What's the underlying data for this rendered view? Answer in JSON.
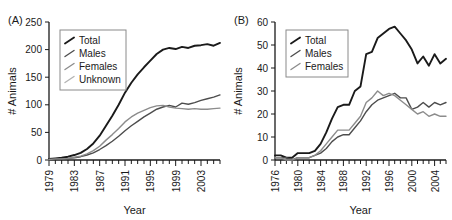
{
  "figure": {
    "panels": [
      {
        "caption": "(A)",
        "ylabel": "# Animals",
        "xlabel": "Year",
        "legend": [
          {
            "label": "Total",
            "color": "#1a1a1a"
          },
          {
            "label": "Males",
            "color": "#4d4d4d"
          },
          {
            "label": "Females",
            "color": "#8c8c8c"
          },
          {
            "label": "Unknown",
            "color": "#b3b3b3"
          }
        ]
      },
      {
        "caption": "(B)",
        "ylabel": "# Animals",
        "xlabel": "Year",
        "legend": [
          {
            "label": "Total",
            "color": "#1a1a1a"
          },
          {
            "label": "Males",
            "color": "#4d4d4d"
          },
          {
            "label": "Females",
            "color": "#8c8c8c"
          }
        ]
      }
    ]
  },
  "chart_data": [
    {
      "type": "line",
      "panel": "(A)",
      "title": "",
      "xlabel": "Year",
      "ylabel": "# Animals",
      "xlim": [
        1979,
        2006
      ],
      "ylim": [
        0,
        250
      ],
      "yticks": [
        0,
        50,
        100,
        150,
        200,
        250
      ],
      "xticks_labeled": [
        1979,
        1983,
        1987,
        1991,
        1995,
        1999,
        2003
      ],
      "xtick_step": 1,
      "grid": false,
      "legend_position": "upper-left",
      "x": [
        1979,
        1980,
        1981,
        1982,
        1983,
        1984,
        1985,
        1986,
        1987,
        1988,
        1989,
        1990,
        1991,
        1992,
        1993,
        1994,
        1995,
        1996,
        1997,
        1998,
        1999,
        2000,
        2001,
        2002,
        2003,
        2004,
        2005,
        2006
      ],
      "series": [
        {
          "name": "Total",
          "color": "#1a1a1a",
          "values": [
            2,
            3,
            4,
            6,
            9,
            13,
            20,
            30,
            44,
            62,
            80,
            100,
            122,
            140,
            155,
            168,
            180,
            192,
            200,
            203,
            201,
            205,
            203,
            207,
            208,
            210,
            207,
            212
          ]
        },
        {
          "name": "Males",
          "color": "#4d4d4d",
          "values": [
            1,
            1,
            2,
            3,
            4,
            6,
            9,
            13,
            19,
            26,
            34,
            43,
            53,
            62,
            70,
            78,
            85,
            92,
            96,
            99,
            96,
            103,
            101,
            104,
            108,
            111,
            114,
            118
          ]
        },
        {
          "name": "Females",
          "color": "#8c8c8c",
          "values": [
            1,
            2,
            2,
            3,
            5,
            7,
            11,
            17,
            25,
            36,
            46,
            57,
            69,
            78,
            85,
            90,
            95,
            98,
            99,
            96,
            94,
            93,
            92,
            93,
            92,
            92,
            93,
            94
          ]
        },
        {
          "name": "Unknown",
          "color": "#b3b3b3",
          "values": [
            0,
            0,
            0,
            0,
            0,
            0,
            0,
            0,
            0,
            0,
            0,
            0,
            0,
            0,
            0,
            0,
            0,
            0,
            0,
            0,
            0,
            0,
            0,
            0,
            0,
            0,
            0,
            0
          ]
        }
      ]
    },
    {
      "type": "line",
      "panel": "(B)",
      "title": "",
      "xlabel": "Year",
      "ylabel": "# Animals",
      "xlim": [
        1976,
        2006
      ],
      "ylim": [
        0,
        60
      ],
      "yticks": [
        0,
        10,
        20,
        30,
        40,
        50,
        60
      ],
      "xticks_labeled": [
        1976,
        1980,
        1984,
        1988,
        1992,
        1996,
        2000,
        2004
      ],
      "xtick_step": 1,
      "grid": false,
      "legend_position": "upper-left",
      "x": [
        1976,
        1977,
        1978,
        1979,
        1980,
        1981,
        1982,
        1983,
        1984,
        1985,
        1986,
        1987,
        1988,
        1989,
        1990,
        1991,
        1992,
        1993,
        1994,
        1995,
        1996,
        1997,
        1998,
        1999,
        2000,
        2001,
        2002,
        2003,
        2004,
        2005,
        2006
      ],
      "series": [
        {
          "name": "Total",
          "color": "#1a1a1a",
          "values": [
            2,
            2,
            1,
            1,
            3,
            3,
            3,
            4,
            7,
            12,
            18,
            23,
            24,
            24,
            30,
            32,
            46,
            47,
            53,
            55,
            57,
            58,
            55,
            52,
            48,
            42,
            45,
            41,
            46,
            42,
            44
          ]
        },
        {
          "name": "Males",
          "color": "#4d4d4d",
          "values": [
            1,
            1,
            1,
            0,
            1,
            1,
            1,
            2,
            3,
            5,
            8,
            10,
            11,
            11,
            14,
            17,
            21,
            24,
            26,
            27,
            28,
            29,
            27,
            27,
            22,
            23,
            25,
            23,
            25,
            24,
            25
          ]
        },
        {
          "name": "Females",
          "color": "#8c8c8c",
          "values": [
            1,
            1,
            0,
            0,
            1,
            1,
            1,
            2,
            4,
            7,
            10,
            13,
            13,
            13,
            16,
            19,
            25,
            27,
            30,
            28,
            29,
            28,
            26,
            24,
            22,
            20,
            21,
            19,
            20,
            19,
            19
          ]
        }
      ]
    }
  ]
}
